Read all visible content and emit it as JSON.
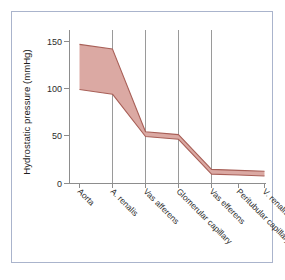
{
  "chart_data": {
    "type": "area",
    "title": "",
    "xlabel": "",
    "ylabel": "Hydrostatic pressure (mmHg)",
    "categories": [
      "Aorta",
      "A. renalis",
      "Vas afferens",
      "Glomerular capillary",
      "Vas efferens",
      "Peritubular capillary",
      "V. renalis"
    ],
    "series": [
      {
        "name": "upper bound",
        "values": [
          148,
          143,
          55,
          52,
          15,
          14,
          13
        ]
      },
      {
        "name": "lower bound",
        "values": [
          100,
          95,
          50,
          47,
          10,
          9,
          8
        ]
      }
    ],
    "ylim": [
      0,
      160
    ],
    "yticks": [
      0,
      50,
      100,
      150
    ],
    "ytick_labels": [
      "0",
      "50",
      "100",
      "150"
    ],
    "grid": "vertical",
    "gridline_categories": [
      "A. renalis",
      "Vas afferens",
      "Glomerular capillary",
      "Vas efferens"
    ],
    "legend": "none",
    "colors": {
      "band_fill": "#dba9a3",
      "band_stroke": "#a85f57",
      "axis": "#8d8d8d",
      "gridline": "#9a9a9a",
      "frame": "#aab4cc",
      "background": "#ffffff",
      "text": "#2b2b2b"
    }
  },
  "axis": {
    "y_title": "Hydrostatic pressure (mmHg)",
    "y_tick_0": "0",
    "y_tick_50": "50",
    "y_tick_100": "100",
    "y_tick_150": "150"
  },
  "categories": {
    "c0": "Aorta",
    "c1": "A. renalis",
    "c2": "Vas afferens",
    "c3": "Glomerular capillary",
    "c4": "Vas efferens",
    "c5": "Peritubular capillary",
    "c6": "V. renalis"
  }
}
